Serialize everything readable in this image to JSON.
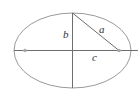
{
  "diagram": {
    "type": "ellipse-geometry",
    "labels": {
      "semi_major_hypotenuse": "a",
      "semi_minor": "b",
      "focal_distance": "c"
    },
    "colors": {
      "background": "#ffffff",
      "ellipse": "#9a9a9a",
      "axes": "#6e6e6e",
      "foci": "#a8a8a8",
      "label": "#333333"
    },
    "geometry": {
      "center": [
        72.5,
        50.5
      ],
      "rx": 58.5,
      "ry": 37.5,
      "left_focus": [
        25,
        50.5
      ],
      "right_focus": [
        119,
        50.5
      ]
    }
  }
}
